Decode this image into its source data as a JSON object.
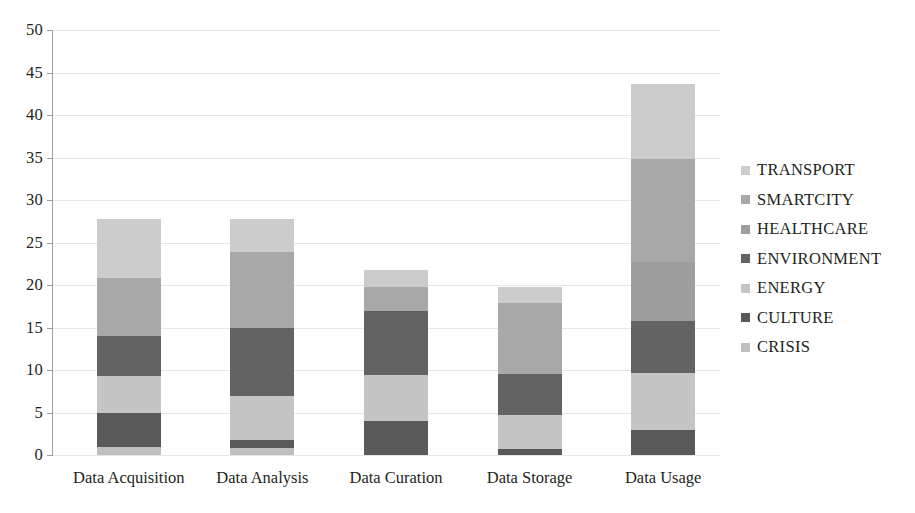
{
  "chart_data": {
    "type": "bar",
    "stacked": true,
    "title": "",
    "xlabel": "",
    "ylabel": "",
    "ylim": [
      0,
      50
    ],
    "ytick_step": 5,
    "yticks": [
      "0",
      "5",
      "10",
      "15",
      "20",
      "25",
      "30",
      "35",
      "40",
      "45",
      "50"
    ],
    "grid": true,
    "legend_position": "right",
    "categories": [
      "Data Acquisition",
      "Data Analysis",
      "Data Curation",
      "Data Storage",
      "Data Usage"
    ],
    "series": [
      {
        "name": "CRISIS",
        "color": "#bfbfbf",
        "values": [
          1.0,
          0.8,
          0.0,
          0.0,
          0.0
        ]
      },
      {
        "name": "CULTURE",
        "color": "#595959",
        "values": [
          4.0,
          1.0,
          4.0,
          0.7,
          2.9
        ]
      },
      {
        "name": "ENERGY",
        "color": "#c5c5c5",
        "values": [
          4.3,
          5.2,
          5.4,
          4.0,
          6.8
        ]
      },
      {
        "name": "ENVIRONMENT",
        "color": "#636363",
        "values": [
          4.7,
          7.9,
          7.6,
          4.8,
          6.1
        ]
      },
      {
        "name": "HEALTHCARE",
        "color": "#9e9e9e",
        "values": [
          0.0,
          0.0,
          0.0,
          0.0,
          6.9
        ]
      },
      {
        "name": "SMARTCITY",
        "color": "#a8a8a8",
        "values": [
          6.8,
          9.0,
          2.8,
          8.4,
          12.1
        ]
      },
      {
        "name": "TRANSPORT",
        "color": "#cccccc",
        "values": [
          7.0,
          3.9,
          2.0,
          1.9,
          8.9
        ]
      }
    ],
    "totals": [
      27.8,
      27.8,
      21.8,
      19.8,
      43.7
    ]
  },
  "legend": {
    "items": [
      {
        "label": "TRANSPORT",
        "color": "#cccccc"
      },
      {
        "label": "SMARTCITY",
        "color": "#a8a8a8"
      },
      {
        "label": "HEALTHCARE",
        "color": "#9e9e9e"
      },
      {
        "label": "ENVIRONMENT",
        "color": "#636363"
      },
      {
        "label": "ENERGY",
        "color": "#c5c5c5"
      },
      {
        "label": "CULTURE",
        "color": "#595959"
      },
      {
        "label": "CRISIS",
        "color": "#bfbfbf"
      }
    ]
  }
}
